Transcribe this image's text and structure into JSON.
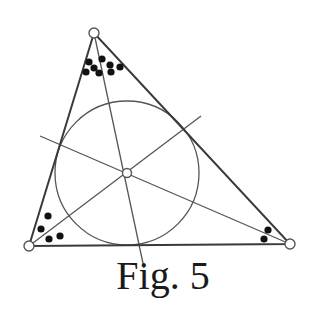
{
  "figure": {
    "caption": "Fig. 5",
    "colors": {
      "line": "#555555",
      "edge": "#3a3a3a",
      "dot": "#111111",
      "vertex_fill": "#ffffff"
    },
    "triangle": {
      "vertices": [
        {
          "name": "top",
          "x": 94,
          "y": 33
        },
        {
          "name": "left",
          "x": 29,
          "y": 246
        },
        {
          "name": "right",
          "x": 290,
          "y": 244
        }
      ]
    },
    "incircle": {
      "cx": 127,
      "cy": 173,
      "r": 72
    },
    "incenter": {
      "x": 127,
      "y": 173
    },
    "bisectors": [
      {
        "name": "from-top",
        "x1": 94,
        "y1": 33,
        "x2": 144,
        "y2": 268
      },
      {
        "name": "from-left",
        "x1": 29,
        "y1": 246,
        "x2": 201,
        "y2": 116
      },
      {
        "name": "from-right",
        "x1": 290,
        "y1": 244,
        "x2": 40,
        "y2": 136
      }
    ],
    "dot_groups": [
      {
        "corner": "top",
        "dots": [
          [
            89,
            62
          ],
          [
            102,
            59
          ],
          [
            94,
            68
          ],
          [
            110,
            65
          ],
          [
            86,
            72
          ],
          [
            99,
            73
          ],
          [
            111,
            72
          ],
          [
            120,
            67
          ]
        ]
      },
      {
        "corner": "left",
        "dots": [
          [
            48,
            216
          ],
          [
            41,
            229
          ],
          [
            49,
            239
          ],
          [
            60,
            236
          ]
        ]
      },
      {
        "corner": "right",
        "dots": [
          [
            268,
            230
          ],
          [
            264,
            239
          ]
        ]
      }
    ]
  }
}
